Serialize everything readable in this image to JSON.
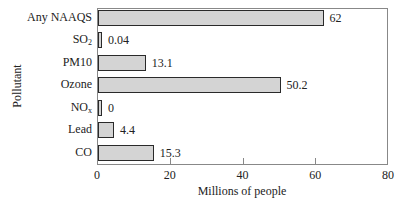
{
  "chart_data": {
    "type": "bar",
    "orientation": "horizontal",
    "title": "",
    "xlabel": "Millions of people",
    "ylabel": "Pollutant",
    "xlim": [
      0,
      80
    ],
    "xticks": [
      0,
      20,
      40,
      60,
      80
    ],
    "grid": false,
    "legend": null,
    "categories": [
      "Any NAAQS",
      "SO2",
      "PM10",
      "Ozone",
      "NOx",
      "Lead",
      "CO"
    ],
    "category_display": [
      {
        "base": "Any NAAQS",
        "sub": ""
      },
      {
        "base": "SO",
        "sub": "2"
      },
      {
        "base": "PM10",
        "sub": ""
      },
      {
        "base": "Ozone",
        "sub": ""
      },
      {
        "base": "NO",
        "sub": "x"
      },
      {
        "base": "Lead",
        "sub": ""
      },
      {
        "base": "CO",
        "sub": ""
      }
    ],
    "values": [
      62,
      0.04,
      13.1,
      50.2,
      0,
      4.4,
      15.3
    ],
    "value_labels": [
      "62",
      "0.04",
      "13.1",
      "50.2",
      "0",
      "4.4",
      "15.3"
    ],
    "colors": {
      "bar_fill": "#d4d4d4",
      "bar_edge": "#2a2a2a",
      "frame": "#888888"
    }
  }
}
